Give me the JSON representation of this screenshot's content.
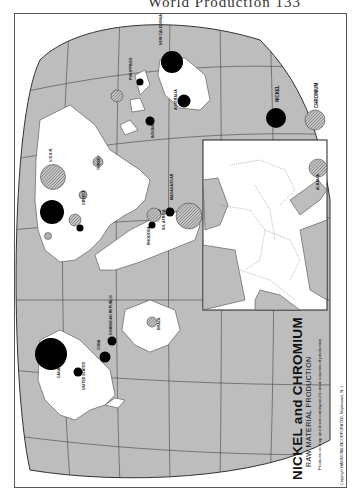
{
  "page": {
    "running_head": "World Production 133"
  },
  "map": {
    "title": "NICKEL and CHROMIUM",
    "subtitle": "RAW MATERIAL PRODUCTION",
    "note": "Products on map and inset correspond to main sources of production.",
    "copyright": "Copyright HAMMOND INCORPORATED, Maplewood, N. J.",
    "legend": [
      {
        "label": "NICKEL",
        "fill": "#000000",
        "pattern": "solid"
      },
      {
        "label": "CHROMIUM",
        "fill": "#9a9a9a",
        "pattern": "hatched"
      }
    ],
    "colors": {
      "ocean": "#bdbdbd",
      "land": "#ffffff",
      "grid": "#444444",
      "nickel": "#000000",
      "chromium": "#999999"
    },
    "country_labels": {
      "new_caledonia": "NEW CALEDONIA",
      "australia": "AUSTRALIA",
      "philippines": "PHILIPPINES",
      "indonesia": "INDONESIA",
      "ussr": "U.S.S.R.",
      "madagascar": "MADAGASCAR",
      "south_africa": "SO. AFRICA",
      "rhodesia": "RHODESIA",
      "turkey": "TURKEY",
      "greece": "GREECE",
      "finland": "FINLAND",
      "canada": "CANADA",
      "united_states": "UNITED STATES",
      "cuba": "CUBA",
      "dominican_republic": "DOMINICAN REPUBLIC",
      "brazil": "BRAZIL",
      "albania": "ALBANIA"
    },
    "inset": {
      "region": "Europe",
      "labels": [
        "ALBANIA"
      ]
    }
  }
}
